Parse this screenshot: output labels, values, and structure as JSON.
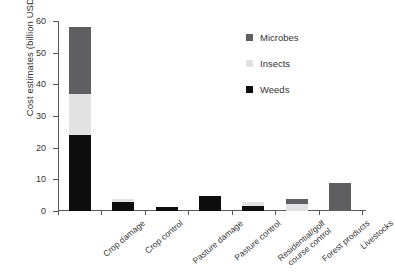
{
  "chart_data": {
    "type": "bar",
    "subtype": "stacked-vertical",
    "title": "",
    "xlabel": "",
    "ylabel": "Cost estimates (billion USD)",
    "ylim": [
      0,
      60
    ],
    "yticks": [
      0,
      10,
      20,
      30,
      40,
      50,
      60
    ],
    "ytick_labels": [
      "0",
      "10",
      "20",
      "30",
      "40",
      "50",
      "60"
    ],
    "grid": false,
    "legend_position": "top-right",
    "categories": [
      "Crop damage",
      "Crop control",
      "Pasture damage",
      "Pasture control",
      "Residential/golf course control",
      "Forest products",
      "Livestocks"
    ],
    "category_label_lines": [
      [
        "Crop damage"
      ],
      [
        "Crop control"
      ],
      [
        "Pasture damage"
      ],
      [
        "Pasture control"
      ],
      [
        "Residential/golf",
        "course control"
      ],
      [
        "Forest products"
      ],
      [
        "Livestocks"
      ]
    ],
    "series": [
      {
        "name": "Weeds",
        "color": "#0d0d0d",
        "values": [
          24,
          3,
          1.2,
          4.7,
          1.5,
          0,
          0
        ]
      },
      {
        "name": "Insects",
        "color": "#e2e2e2",
        "values": [
          13,
          0.8,
          0,
          0,
          1.3,
          2.1,
          0
        ]
      },
      {
        "name": "Microbes",
        "color": "#5f5f61",
        "values": [
          21,
          0,
          0,
          0,
          0,
          1.7,
          9
        ]
      }
    ],
    "totals": [
      58,
      3.8,
      1.2,
      4.7,
      2.8,
      3.8,
      9
    ]
  },
  "legend": {
    "entries": [
      {
        "label": "Microbes",
        "color": "#5f5f61"
      },
      {
        "label": "Insects",
        "color": "#e2e2e2"
      },
      {
        "label": "Weeds",
        "color": "#0d0d0d"
      }
    ]
  }
}
